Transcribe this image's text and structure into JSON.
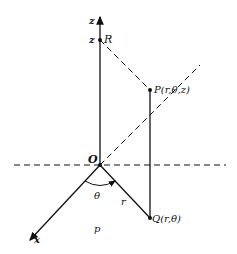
{
  "diagram": {
    "labels": {
      "z_axis": "z",
      "z_value": "z",
      "R": "R",
      "P": "P(r,θ,z)",
      "O": "O",
      "theta": "θ",
      "r": "r",
      "Q": "Q(r,θ)",
      "x_axis": "x",
      "plane": "p"
    },
    "colors": {
      "line": "#111111",
      "background": "#ffffff"
    }
  }
}
